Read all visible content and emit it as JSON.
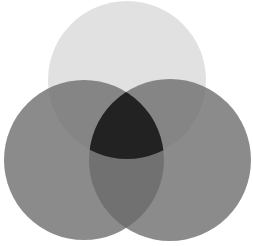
{
  "diagram": {
    "type": "venn",
    "set_count": 3,
    "background": "#ffffff",
    "circles": [
      {
        "id": "top",
        "cx": 127,
        "cy": 80,
        "r": 79,
        "color": "#c8c8c8",
        "opacity": 0.55
      },
      {
        "id": "left",
        "cx": 84,
        "cy": 160,
        "r": 80,
        "color": "#6a6a6a",
        "opacity": 0.78
      },
      {
        "id": "right",
        "cx": 170,
        "cy": 160,
        "r": 81,
        "color": "#6a6a6a",
        "opacity": 0.78
      }
    ],
    "center_region_color": "#222222",
    "labels": []
  }
}
